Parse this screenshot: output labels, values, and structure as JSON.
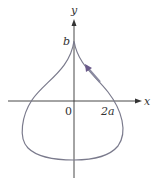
{
  "diagram": {
    "type": "parametric-curve",
    "axes": {
      "x_label": "x",
      "y_label": "y"
    },
    "labels": {
      "origin": "0",
      "x_tick": "2a",
      "y_tick": "b"
    },
    "curve": {
      "shape": "teardrop",
      "cusp": "top at (0, b)",
      "direction": "counterclockwise arrow on right upper branch",
      "color": "#7a7a8c"
    },
    "colors": {
      "axis": "#333333",
      "curve": "#7a7a8c",
      "arrow": "#6a5a8a"
    }
  }
}
